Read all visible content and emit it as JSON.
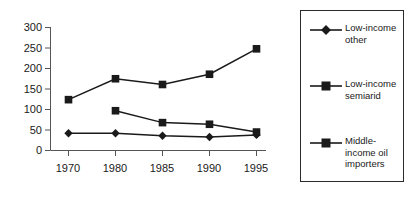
{
  "chart_data": {
    "type": "line",
    "title": "",
    "xlabel": "",
    "ylabel": "",
    "categories": [
      "1970",
      "1980",
      "1985",
      "1990",
      "1995"
    ],
    "ylim": [
      0,
      300
    ],
    "yticks": [
      0,
      50,
      100,
      150,
      200,
      250,
      300
    ],
    "grid": false,
    "legend_position": "right",
    "series": [
      {
        "name": "Low-income other",
        "marker": "diamond",
        "values": [
          42,
          42,
          36,
          33,
          38
        ]
      },
      {
        "name": "Low-income semiarid",
        "marker": "square",
        "values": [
          null,
          97,
          68,
          64,
          45
        ]
      },
      {
        "name": "Middle-income oil importers",
        "marker": "square",
        "values": [
          124,
          175,
          161,
          186,
          248
        ]
      }
    ]
  },
  "axes": {
    "y_tick_labels": [
      "300",
      "250",
      "200",
      "150",
      "100",
      "50",
      "0"
    ],
    "x_tick_labels": [
      "1970",
      "1980",
      "1985",
      "1990",
      "1995"
    ]
  },
  "legend": {
    "entries": [
      {
        "label": "Low-income\nother",
        "marker": "diamond-marker"
      },
      {
        "label": "Low-income\nsemiarid",
        "marker": "square-marker"
      },
      {
        "label": "Middle-\nincome oil\nimporters",
        "marker": "square-marker"
      }
    ]
  }
}
